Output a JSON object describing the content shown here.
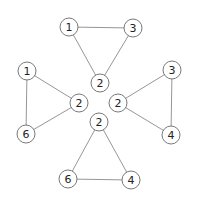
{
  "diagram": {
    "type": "graph",
    "node_radius": 9,
    "colors": {
      "edge": "#8a8a8a",
      "node_stroke": "#6a6a6a",
      "node_fill": "#ffffff",
      "text": "#222222",
      "background": "#ffffff"
    },
    "triangles": [
      {
        "id": "top",
        "nodes": [
          {
            "label": "1",
            "x": 69,
            "y": 27
          },
          {
            "label": "3",
            "x": 133,
            "y": 28
          },
          {
            "label": "2",
            "x": 100,
            "y": 83
          }
        ],
        "edges": [
          [
            "1",
            "3"
          ],
          [
            "1",
            "2"
          ],
          [
            "3",
            "2"
          ]
        ]
      },
      {
        "id": "left",
        "nodes": [
          {
            "label": "1",
            "x": 27,
            "y": 71
          },
          {
            "label": "2",
            "x": 79,
            "y": 103
          },
          {
            "label": "6",
            "x": 26,
            "y": 134
          }
        ],
        "edges": [
          [
            "1",
            "2"
          ],
          [
            "1",
            "6"
          ],
          [
            "2",
            "6"
          ]
        ]
      },
      {
        "id": "right",
        "nodes": [
          {
            "label": "3",
            "x": 172,
            "y": 70
          },
          {
            "label": "2",
            "x": 118,
            "y": 103
          },
          {
            "label": "4",
            "x": 171,
            "y": 135
          }
        ],
        "edges": [
          [
            "3",
            "2"
          ],
          [
            "3",
            "4"
          ],
          [
            "2",
            "4"
          ]
        ]
      },
      {
        "id": "bottom",
        "nodes": [
          {
            "label": "2",
            "x": 99,
            "y": 122
          },
          {
            "label": "6",
            "x": 68,
            "y": 179
          },
          {
            "label": "4",
            "x": 131,
            "y": 180
          }
        ],
        "edges": [
          [
            "2",
            "6"
          ],
          [
            "2",
            "4"
          ],
          [
            "6",
            "4"
          ]
        ]
      }
    ]
  }
}
